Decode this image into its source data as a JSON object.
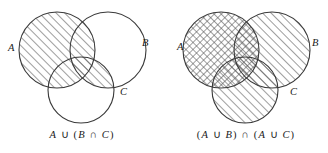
{
  "figure": {
    "background_color": "#ffffff",
    "stroke_color": "#3a3a3a",
    "hatch_color": "#555555"
  },
  "panels": [
    {
      "id": "left",
      "caption": "A ∪ (B ∩ C)",
      "caption_parts": {
        "p1": "A",
        "p2": "∪",
        "p3": "(",
        "p4": "B",
        "p5": "∩",
        "p6": "C",
        "p7": ")"
      },
      "labels": {
        "a": "A",
        "b": "B",
        "c": "C"
      },
      "shaded_regions": [
        "A",
        "B ∩ C"
      ],
      "fill_style": "single-diagonal-hatch"
    },
    {
      "id": "right",
      "caption": "(A ∪ B) ∩ (A ∪ C)",
      "caption_parts": {
        "p1": "(",
        "p2": "A",
        "p3": "∪",
        "p4": "B",
        "p5": ")",
        "p6": "∩",
        "p7": "(",
        "p8": "A",
        "p9": "∪",
        "p10": "C",
        "p11": ")"
      },
      "labels": {
        "a": "A",
        "b": "B",
        "c": "C"
      },
      "shaded_regions": [
        "A",
        "B",
        "C"
      ],
      "fill_style": "cross-hatch-on-A, single-diagonal-hatch-on-B-and-C"
    }
  ],
  "geometry": {
    "left": {
      "circle_a": {
        "cx": 57,
        "cy": 50,
        "r": 38
      },
      "circle_b": {
        "cx": 108,
        "cy": 50,
        "r": 38
      },
      "circle_c": {
        "cx": 81,
        "cy": 90,
        "r": 33
      }
    },
    "right": {
      "circle_a": {
        "cx": 57,
        "cy": 50,
        "r": 38
      },
      "circle_b": {
        "cx": 108,
        "cy": 50,
        "r": 38
      },
      "circle_c": {
        "cx": 81,
        "cy": 90,
        "r": 33
      }
    }
  },
  "label_positions": {
    "left": {
      "a": {
        "x": 8,
        "y": 43
      },
      "b": {
        "x": 142,
        "y": 38
      },
      "c": {
        "x": 120,
        "y": 87
      }
    },
    "right": {
      "a": {
        "x": 13,
        "y": 42
      },
      "b": {
        "x": 148,
        "y": 38
      },
      "c": {
        "x": 126,
        "y": 87
      }
    }
  }
}
